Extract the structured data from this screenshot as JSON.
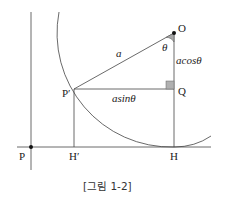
{
  "figure": {
    "caption": "[그림 1-2]",
    "points": {
      "O": "O",
      "P": "P",
      "P_prime": "P′",
      "Q": "Q",
      "H": "H",
      "H_prime": "H′"
    },
    "segment_labels": {
      "OP_prime": "a",
      "angle": "θ",
      "OQ": "acosθ",
      "P_primeQ": "asinθ"
    },
    "colors": {
      "line": "#444444",
      "angle_fill": "#a8a8a8",
      "right_angle_fill": "#b0b0b0",
      "dot": "#111111"
    }
  }
}
